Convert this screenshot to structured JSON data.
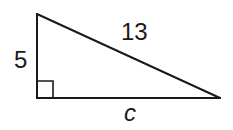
{
  "diagram": {
    "type": "right-triangle",
    "vertices": {
      "top": [
        37,
        14
      ],
      "right_angle": [
        37,
        98
      ],
      "right": [
        220,
        98
      ]
    },
    "right_angle_marker": true,
    "labels": {
      "vertical_leg": "5",
      "hypotenuse": "13",
      "horizontal_leg": "c"
    },
    "stroke_color": "#1a1a1a"
  }
}
